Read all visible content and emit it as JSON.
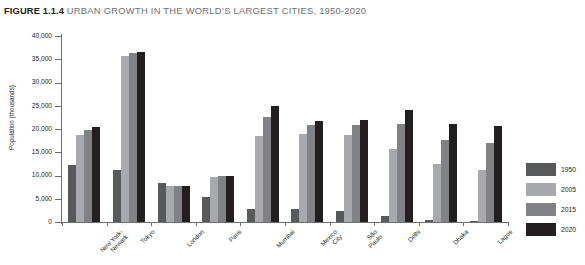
{
  "title": {
    "number": "FIGURE 1.1.4",
    "text": "URBAN GROWTH IN THE WORLD’S LARGEST CITIES, 1950-2020"
  },
  "colors": {
    "series_1950": "#58595b",
    "series_2005": "#a7a9ac",
    "series_2015": "#808285",
    "series_2020": "#231f20",
    "axis": "#6d6e71",
    "title_accent": "#6d6e71",
    "text": "#231f20",
    "background": "#ffffff"
  },
  "chart_data": {
    "type": "bar",
    "title": "URBAN GROWTH IN THE WORLD’S LARGEST CITIES, 1950-2020",
    "xlabel": "",
    "ylabel": "Population (thousands)",
    "ylim": [
      0,
      40000
    ],
    "ytick_step": 5000,
    "yticks": [
      0,
      5000,
      10000,
      15000,
      20000,
      25000,
      30000,
      35000,
      40000
    ],
    "ytick_labels": [
      "0",
      "5,000",
      "10,000",
      "15,000",
      "20,000",
      "25,000",
      "30,000",
      "35,000",
      "40,000"
    ],
    "grid": false,
    "legend_position": "right",
    "categories": [
      "New York-\nNewark",
      "Tokyo",
      "London",
      "Paris",
      "Mumbai",
      "Mexico\nCity",
      "São\nPaulo",
      "Delhi",
      "Dhaka",
      "Lagos"
    ],
    "series": [
      {
        "name": "1950",
        "color": "#58595b",
        "values": [
          12338,
          11275,
          8361,
          5425,
          2857,
          2883,
          2334,
          1369,
          336,
          325
        ]
      },
      {
        "name": "2005",
        "color": "#a7a9ac",
        "values": [
          18718,
          35622,
          7668,
          9785,
          18600,
          19013,
          18647,
          15692,
          12576,
          11135
        ]
      },
      {
        "name": "2015",
        "color": "#808285",
        "values": [
          19795,
          36400,
          7700,
          10000,
          22600,
          20900,
          20900,
          21000,
          17600,
          17000
        ]
      },
      {
        "name": "2020",
        "color": "#231f20",
        "values": [
          20500,
          36600,
          7700,
          10000,
          25000,
          21800,
          22000,
          24000,
          21000,
          20700
        ]
      }
    ]
  },
  "legend": {
    "entries": [
      {
        "label": "1950",
        "color": "#58595b"
      },
      {
        "label": "2005",
        "color": "#a7a9ac"
      },
      {
        "label": "2015",
        "color": "#808285"
      },
      {
        "label": "2020",
        "color": "#231f20"
      }
    ]
  }
}
